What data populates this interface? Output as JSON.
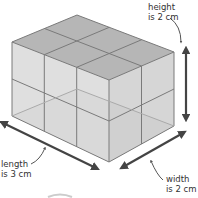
{
  "diagram": {
    "shape": "rectangular prism",
    "unit_cube_edge": "1 cm",
    "dimensions": {
      "length": 3,
      "width": 2,
      "height": 2,
      "unit": "cm"
    },
    "labels": {
      "height_line1": "height",
      "height_line2": "is 2 cm",
      "length_line1": "length",
      "length_line2": "is 3 cm",
      "width_line1": "width",
      "width_line2": "is 2 cm"
    },
    "colors": {
      "edge": "#7a7a7a",
      "top_face": "#b4b4b4",
      "front_face": "#d6d6d6",
      "side_face": "#cdcdcd",
      "arrow": "#444444"
    }
  }
}
